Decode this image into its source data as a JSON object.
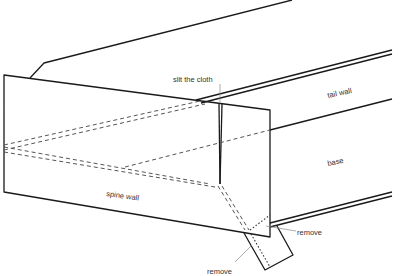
{
  "diagram": {
    "labels": {
      "slit": "slit the cloth",
      "tail_wall": "tail wall",
      "base": "base",
      "spine_wall": "spine wall",
      "remove_right": "remove",
      "remove_bottom": "remove"
    }
  }
}
